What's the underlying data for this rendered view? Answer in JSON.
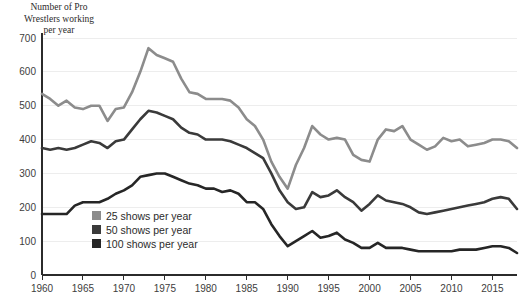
{
  "chart_data": {
    "type": "line",
    "title": "Number of Pro\nWrestlers working\nper year",
    "xlabel": "",
    "ylabel": "",
    "xlim": [
      1960,
      2018
    ],
    "ylim": [
      0,
      700
    ],
    "grid": true,
    "legend_position": "inside-lower-left",
    "x_ticks": [
      1960,
      1965,
      1970,
      1975,
      1980,
      1985,
      1990,
      1995,
      2000,
      2005,
      2010,
      2015
    ],
    "y_ticks": [
      0,
      100,
      200,
      300,
      400,
      500,
      600,
      700
    ],
    "x": [
      1960,
      1961,
      1962,
      1963,
      1964,
      1965,
      1966,
      1967,
      1968,
      1969,
      1970,
      1971,
      1972,
      1973,
      1974,
      1975,
      1976,
      1977,
      1978,
      1979,
      1980,
      1981,
      1982,
      1983,
      1984,
      1985,
      1986,
      1987,
      1988,
      1989,
      1990,
      1991,
      1992,
      1993,
      1994,
      1995,
      1996,
      1997,
      1998,
      1999,
      2000,
      2001,
      2002,
      2003,
      2004,
      2005,
      2006,
      2007,
      2008,
      2009,
      2010,
      2011,
      2012,
      2013,
      2014,
      2015,
      2016,
      2017,
      2018
    ],
    "series": [
      {
        "name": "25 shows per year",
        "color": "#8c8c8c",
        "values": [
          535,
          520,
          500,
          515,
          495,
          490,
          500,
          500,
          455,
          490,
          495,
          540,
          600,
          670,
          650,
          640,
          630,
          580,
          540,
          535,
          520,
          520,
          520,
          515,
          495,
          460,
          440,
          400,
          335,
          290,
          255,
          325,
          375,
          440,
          415,
          400,
          405,
          400,
          355,
          340,
          335,
          400,
          430,
          425,
          440,
          400,
          385,
          370,
          380,
          405,
          395,
          400,
          380,
          385,
          390,
          400,
          400,
          395,
          375
        ]
      },
      {
        "name": "50 shows per year",
        "color": "#3a3a3a",
        "values": [
          375,
          370,
          375,
          370,
          375,
          385,
          395,
          390,
          375,
          395,
          400,
          430,
          460,
          485,
          480,
          470,
          460,
          435,
          420,
          415,
          400,
          400,
          400,
          395,
          385,
          375,
          360,
          345,
          300,
          250,
          215,
          195,
          200,
          245,
          230,
          235,
          250,
          230,
          215,
          190,
          210,
          235,
          220,
          215,
          210,
          200,
          185,
          180,
          185,
          190,
          195,
          200,
          205,
          210,
          215,
          225,
          230,
          225,
          195
        ]
      },
      {
        "name": "100 shows per year",
        "color": "#262626",
        "values": [
          180,
          180,
          180,
          180,
          205,
          215,
          215,
          215,
          225,
          240,
          250,
          265,
          290,
          295,
          300,
          300,
          290,
          280,
          270,
          265,
          255,
          255,
          245,
          250,
          240,
          215,
          215,
          195,
          150,
          115,
          85,
          100,
          115,
          130,
          110,
          115,
          125,
          105,
          95,
          80,
          80,
          95,
          80,
          80,
          80,
          75,
          70,
          70,
          70,
          70,
          70,
          75,
          75,
          75,
          80,
          85,
          85,
          80,
          65
        ]
      }
    ]
  },
  "legend": {
    "items": [
      {
        "label": "25 shows per year",
        "color": "#8c8c8c"
      },
      {
        "label": "50 shows per year",
        "color": "#3a3a3a"
      },
      {
        "label": "100 shows per year",
        "color": "#262626"
      }
    ]
  }
}
